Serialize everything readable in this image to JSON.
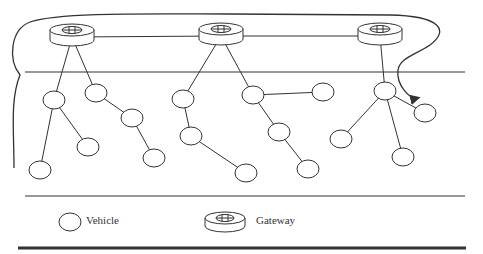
{
  "diagram": {
    "type": "vehicular-network",
    "colors": {
      "stroke": "#333333",
      "background": "#ffffff"
    },
    "gateways": [
      {
        "id": "gw1",
        "x": 72,
        "y": 34
      },
      {
        "id": "gw2",
        "x": 221,
        "y": 33
      },
      {
        "id": "gw3",
        "x": 380,
        "y": 33
      }
    ],
    "vehicles": [
      {
        "id": "A",
        "x": 54,
        "y": 100
      },
      {
        "id": "B",
        "x": 96,
        "y": 93
      },
      {
        "id": "C",
        "x": 132,
        "y": 118
      },
      {
        "id": "D",
        "x": 88,
        "y": 147
      },
      {
        "id": "E",
        "x": 40,
        "y": 170
      },
      {
        "id": "F",
        "x": 154,
        "y": 158
      },
      {
        "id": "G",
        "x": 183,
        "y": 99
      },
      {
        "id": "H",
        "x": 191,
        "y": 136
      },
      {
        "id": "I",
        "x": 246,
        "y": 173
      },
      {
        "id": "J",
        "x": 253,
        "y": 95
      },
      {
        "id": "K",
        "x": 323,
        "y": 92
      },
      {
        "id": "L",
        "x": 279,
        "y": 132
      },
      {
        "id": "M",
        "x": 308,
        "y": 169
      },
      {
        "id": "N",
        "x": 385,
        "y": 91
      },
      {
        "id": "O",
        "x": 425,
        "y": 113
      },
      {
        "id": "P",
        "x": 341,
        "y": 139
      },
      {
        "id": "Q",
        "x": 403,
        "y": 157
      }
    ],
    "links": [
      [
        "gw1",
        "gw2"
      ],
      [
        "gw2",
        "gw3"
      ],
      [
        "gw1",
        "A"
      ],
      [
        "gw1",
        "B"
      ],
      [
        "A",
        "D"
      ],
      [
        "A",
        "E"
      ],
      [
        "B",
        "C"
      ],
      [
        "C",
        "F"
      ],
      [
        "gw2",
        "G"
      ],
      [
        "gw2",
        "J"
      ],
      [
        "G",
        "H"
      ],
      [
        "H",
        "I"
      ],
      [
        "J",
        "K"
      ],
      [
        "J",
        "L"
      ],
      [
        "L",
        "M"
      ],
      [
        "gw3",
        "N"
      ],
      [
        "N",
        "O"
      ],
      [
        "N",
        "P"
      ],
      [
        "N",
        "Q"
      ]
    ],
    "road_lines": [
      {
        "x1": 25,
        "y1": 72,
        "x2": 465,
        "y2": 72,
        "width": 1
      },
      {
        "x1": 25,
        "y1": 196,
        "x2": 465,
        "y2": 196,
        "width": 1
      },
      {
        "x1": 18,
        "y1": 248,
        "x2": 466,
        "y2": 248,
        "width": 3
      }
    ]
  },
  "legend": {
    "vehicle_label": "Vehicle",
    "gateway_label": "Gateway"
  }
}
